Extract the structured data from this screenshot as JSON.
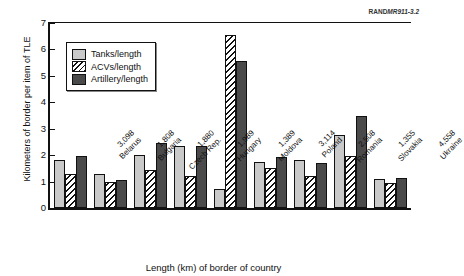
{
  "source_mark": {
    "prefix": "RAND",
    "number": "MR911-3.2"
  },
  "chart_data": {
    "type": "bar",
    "title": "",
    "xlabel": "Length (km) of border of country",
    "ylabel": "Kilometers of border per item of TLE",
    "ylim": [
      0,
      7
    ],
    "yticks": [
      0,
      1,
      2,
      3,
      4,
      5,
      6,
      7
    ],
    "grid": false,
    "legend_position": "upper-left-inside",
    "categories": [
      "Belarus",
      "Bulgaria",
      "Czech Rep.",
      "Hungary",
      "Moldova",
      "Poland",
      "Romania",
      "Slovakia",
      "Ukraine"
    ],
    "category_lengths": [
      "3,098",
      "1,808",
      "1,880",
      "1,989",
      "1,389",
      "3,114",
      "2,508",
      "1,355",
      "4,558"
    ],
    "tick_labels": [
      {
        "length": "3,098",
        "country": "Belarus"
      },
      {
        "length": "1,808",
        "country": "Bulgaria"
      },
      {
        "length": "1,880",
        "country": "Czech Rep."
      },
      {
        "length": "1,989",
        "country": "Hungary"
      },
      {
        "length": "1,389",
        "country": "Moldova"
      },
      {
        "length": "3,114",
        "country": "Poland"
      },
      {
        "length": "2,508",
        "country": "Romania"
      },
      {
        "length": "1,355",
        "country": "Slovakia"
      },
      {
        "length": "4,558",
        "country": "Ukraine"
      }
    ],
    "series": [
      {
        "name": "Tanks/length",
        "color": "#c9c9c9",
        "values": [
          1.8,
          1.27,
          2.01,
          2.36,
          0.72,
          1.76,
          1.82,
          2.76,
          1.11
        ]
      },
      {
        "name": "ACVs/length",
        "color": "#ffffff",
        "pattern": "diagonal-hatch",
        "values": [
          1.28,
          0.97,
          1.42,
          1.2,
          6.55,
          1.5,
          1.23,
          1.97,
          0.93
        ]
      },
      {
        "name": "Artillery/length",
        "color": "#4a4a4a",
        "values": [
          1.95,
          1.07,
          2.47,
          2.36,
          5.55,
          1.92,
          1.7,
          3.5,
          1.12
        ]
      }
    ]
  }
}
